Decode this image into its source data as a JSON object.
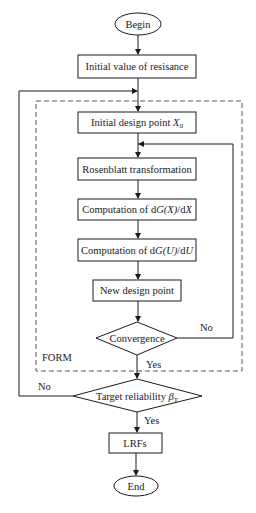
{
  "diagram": {
    "type": "flowchart",
    "nodes": {
      "begin": {
        "label": "Begin",
        "shape": "ellipse"
      },
      "initial_resistance": {
        "label": "Initial value of resisance",
        "shape": "rect"
      },
      "initial_design_point": {
        "label": "Initial design point ",
        "var": "X",
        "sub": "0",
        "shape": "rect"
      },
      "rosenblatt": {
        "label": "Rosenblatt transformation",
        "shape": "rect"
      },
      "comp_dgx": {
        "prefix": "Computation of d",
        "func": "G",
        "arg": "(X)",
        "mid": "/d",
        "var": "X",
        "shape": "rect"
      },
      "comp_dgu": {
        "prefix": "Computation of d",
        "func": "G",
        "arg": "(U)",
        "mid": "/d",
        "var": "U",
        "shape": "rect"
      },
      "new_design_point": {
        "label": "New design point",
        "shape": "rect"
      },
      "convergence": {
        "label": "Convergence",
        "shape": "diamond"
      },
      "target_reliability": {
        "label": "Target reliability ",
        "symbol": "β",
        "sub": "T",
        "shape": "diamond"
      },
      "lrfs": {
        "label": "LRFs",
        "shape": "rect"
      },
      "end": {
        "label": "End",
        "shape": "ellipse"
      }
    },
    "group": {
      "label": "FORM",
      "style": "dashed"
    },
    "edge_labels": {
      "convergence_no": "No",
      "convergence_yes": "Yes",
      "target_no": "No",
      "target_yes": "Yes"
    },
    "colors": {
      "stroke": "#1a1a1a",
      "dashed": "#555555",
      "background": "#ffffff"
    }
  }
}
